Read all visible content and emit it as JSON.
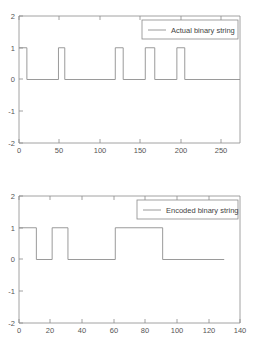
{
  "figure": {
    "background_color": "#ffffff",
    "line_color": "#8f8f8f",
    "axis_color": "#8a8a8a",
    "text_color": "#555555"
  },
  "chart_data": [
    {
      "type": "line",
      "title": "",
      "subtitle": "",
      "xlabel": "",
      "ylabel": "",
      "legend": [
        "Actual binary string"
      ],
      "legend_position": "top-right",
      "grid": false,
      "xlim": [
        0,
        280
      ],
      "ylim": [
        -2,
        2
      ],
      "xticks": [
        0,
        50,
        100,
        150,
        200,
        250
      ],
      "xticklabels": [
        "0",
        "50",
        "100",
        "150",
        "200",
        "250"
      ],
      "yticks": [
        -2,
        -1,
        0,
        1,
        2
      ],
      "yticklabels": [
        "-2",
        "-1",
        "0",
        "1",
        "2"
      ],
      "series": [
        {
          "name": "Actual binary string",
          "style": "step",
          "x": [
            0,
            10,
            10,
            50,
            50,
            58,
            58,
            122,
            122,
            132,
            132,
            160,
            160,
            172,
            172,
            200,
            200,
            210,
            210,
            280
          ],
          "y": [
            1,
            1,
            0,
            0,
            1,
            1,
            0,
            0,
            1,
            1,
            0,
            0,
            1,
            1,
            0,
            0,
            1,
            1,
            0,
            0
          ]
        }
      ]
    },
    {
      "type": "line",
      "title": "",
      "subtitle": "",
      "xlabel": "",
      "ylabel": "",
      "legend": [
        "Encoded binary string"
      ],
      "legend_position": "top-right",
      "grid": false,
      "xlim": [
        0,
        140
      ],
      "ylim": [
        -2,
        2
      ],
      "xticks": [
        0,
        20,
        40,
        60,
        80,
        100,
        120,
        140
      ],
      "xticklabels": [
        "0",
        "20",
        "40",
        "60",
        "80",
        "100",
        "120",
        "140"
      ],
      "yticks": [
        -2,
        -1,
        0,
        1,
        2
      ],
      "yticklabels": [
        "-2",
        "-1",
        "0",
        "1",
        "2"
      ],
      "series": [
        {
          "name": "Encoded binary string",
          "style": "step",
          "x": [
            0,
            11,
            11,
            21,
            21,
            31,
            31,
            61,
            61,
            91,
            91,
            130
          ],
          "y": [
            1,
            1,
            0,
            0,
            1,
            1,
            0,
            0,
            1,
            1,
            0,
            0
          ]
        }
      ]
    }
  ],
  "panels": {
    "top": {
      "legend_label": "Actual binary string",
      "xticklabels": [
        "0",
        "50",
        "100",
        "150",
        "200",
        "250"
      ],
      "yticklabels": [
        "2",
        "1",
        "0",
        "-1",
        "-2"
      ]
    },
    "bottom": {
      "legend_label": "Encoded binary string",
      "xticklabels": [
        "0",
        "20",
        "40",
        "60",
        "80",
        "100",
        "120",
        "140"
      ],
      "yticklabels": [
        "2",
        "1",
        "0",
        "-1",
        "-2"
      ]
    }
  }
}
